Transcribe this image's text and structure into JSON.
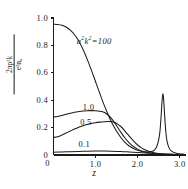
{
  "chart_data": {
    "type": "line",
    "title": "",
    "xlabel": "z",
    "ylabel_numerator": "2πρ²k",
    "ylabel_denominator": "e²n₀",
    "xlim": [
      0,
      3.15
    ],
    "ylim": [
      0,
      1.0
    ],
    "grid": false,
    "legend": "inline-curve-labels",
    "xticks": [
      {
        "value": 0,
        "label": "0"
      },
      {
        "value": 1.0,
        "label": "1.0"
      },
      {
        "value": 2.0,
        "label": "2.0"
      },
      {
        "value": 3.0,
        "label": "3.0"
      }
    ],
    "yticks": [
      {
        "value": 0,
        "label": "0"
      },
      {
        "value": 0.2,
        "label": "0.2"
      },
      {
        "value": 0.4,
        "label": "0.4"
      },
      {
        "value": 0.6,
        "label": "0.6"
      },
      {
        "value": 0.8,
        "label": "0.8"
      },
      {
        "value": 1.0,
        "label": "1.0"
      }
    ],
    "annotations": [
      {
        "text": "a²k² = 100",
        "x": 0.72,
        "y": 0.83,
        "curve": "a2k2_100"
      }
    ],
    "series": [
      {
        "name": "a2k2_100",
        "label": "a²k² = 100",
        "label_x": 0.72,
        "label_y": 0.83,
        "x": [
          0.0,
          0.1,
          0.2,
          0.3,
          0.4,
          0.5,
          0.6,
          0.7,
          0.8,
          0.9,
          1.0,
          1.1,
          1.2,
          1.3,
          1.4,
          1.5,
          1.6,
          1.7,
          1.8,
          1.9,
          2.0,
          2.1,
          2.2,
          2.3,
          2.35,
          2.4,
          2.45,
          2.5,
          2.53,
          2.56,
          2.58,
          2.6,
          2.62,
          2.64,
          2.67,
          2.7,
          2.75,
          2.8,
          2.9,
          3.0,
          3.1
        ],
        "y": [
          0.955,
          0.953,
          0.947,
          0.934,
          0.912,
          0.878,
          0.832,
          0.772,
          0.7,
          0.62,
          0.535,
          0.45,
          0.368,
          0.294,
          0.228,
          0.173,
          0.128,
          0.093,
          0.066,
          0.047,
          0.034,
          0.026,
          0.022,
          0.023,
          0.027,
          0.036,
          0.058,
          0.11,
          0.17,
          0.29,
          0.39,
          0.445,
          0.4,
          0.3,
          0.17,
          0.1,
          0.05,
          0.03,
          0.014,
          0.008,
          0.006
        ]
      },
      {
        "name": "a2k2_1p0",
        "label": "1.0",
        "label_x": 0.86,
        "label_y": 0.345,
        "x": [
          0.0,
          0.1,
          0.2,
          0.3,
          0.4,
          0.5,
          0.6,
          0.7,
          0.8,
          0.9,
          1.0,
          1.1,
          1.15,
          1.2,
          1.3,
          1.4,
          1.5,
          1.6,
          1.7,
          1.8,
          1.9,
          2.0,
          2.1,
          2.2,
          2.3,
          2.4,
          2.5,
          2.6,
          2.8,
          3.0,
          3.1
        ],
        "y": [
          0.278,
          0.281,
          0.288,
          0.297,
          0.305,
          0.312,
          0.317,
          0.321,
          0.323,
          0.324,
          0.323,
          0.32,
          0.317,
          0.312,
          0.292,
          0.258,
          0.214,
          0.167,
          0.124,
          0.089,
          0.062,
          0.043,
          0.03,
          0.021,
          0.015,
          0.011,
          0.008,
          0.006,
          0.004,
          0.003,
          0.002
        ]
      },
      {
        "name": "a2k2_0p5",
        "label": "0.5",
        "label_x": 0.8,
        "label_y": 0.235,
        "x": [
          0.0,
          0.1,
          0.2,
          0.3,
          0.4,
          0.5,
          0.6,
          0.7,
          0.8,
          0.9,
          1.0,
          1.1,
          1.2,
          1.3,
          1.35,
          1.4,
          1.45,
          1.5,
          1.6,
          1.7,
          1.8,
          1.9,
          2.0,
          2.1,
          2.2,
          2.3,
          2.4,
          2.5,
          2.6,
          2.8,
          3.0,
          3.1
        ],
        "y": [
          0.128,
          0.133,
          0.145,
          0.16,
          0.175,
          0.19,
          0.203,
          0.214,
          0.223,
          0.23,
          0.236,
          0.24,
          0.243,
          0.244,
          0.244,
          0.242,
          0.238,
          0.231,
          0.208,
          0.175,
          0.138,
          0.103,
          0.073,
          0.05,
          0.034,
          0.023,
          0.016,
          0.011,
          0.008,
          0.005,
          0.003,
          0.002
        ]
      },
      {
        "name": "a2k2_0p1",
        "label": "0.1",
        "label_x": 0.76,
        "label_y": 0.075,
        "x": [
          0.0,
          0.2,
          0.4,
          0.6,
          0.8,
          1.0,
          1.2,
          1.4,
          1.6,
          1.8,
          2.0,
          2.2,
          2.4,
          2.6,
          2.8,
          3.0,
          3.1
        ],
        "y": [
          0.02,
          0.022,
          0.024,
          0.026,
          0.028,
          0.029,
          0.029,
          0.028,
          0.026,
          0.022,
          0.018,
          0.014,
          0.01,
          0.007,
          0.005,
          0.003,
          0.003
        ]
      }
    ]
  }
}
